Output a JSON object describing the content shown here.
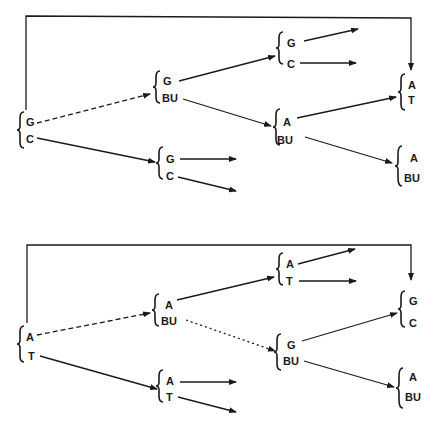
{
  "diagrams": [
    {
      "id": "top",
      "nodes": [
        {
          "id": "t_root",
          "top": "G",
          "bottom": "C"
        },
        {
          "id": "t_mid_upper",
          "top": "G",
          "bottom": "BU"
        },
        {
          "id": "t_mid_lower",
          "top": "G",
          "bottom": "C"
        },
        {
          "id": "t_r1",
          "top": "G",
          "bottom": "C"
        },
        {
          "id": "t_r2",
          "top": "A",
          "bottom": "BU"
        },
        {
          "id": "t_far1",
          "top": "A",
          "bottom": "T"
        },
        {
          "id": "t_far2",
          "top": "A",
          "bottom": "BU"
        }
      ]
    },
    {
      "id": "bottom",
      "nodes": [
        {
          "id": "b_root",
          "top": "A",
          "bottom": "T"
        },
        {
          "id": "b_mid_upper",
          "top": "A",
          "bottom": "BU"
        },
        {
          "id": "b_mid_lower",
          "top": "A",
          "bottom": "T"
        },
        {
          "id": "b_r1",
          "top": "A",
          "bottom": "T"
        },
        {
          "id": "b_r2",
          "top": "G",
          "bottom": "BU"
        },
        {
          "id": "b_far1",
          "top": "G",
          "bottom": "C"
        },
        {
          "id": "b_far2",
          "top": "A",
          "bottom": "BU"
        }
      ]
    }
  ],
  "colors": {
    "ink": "#1a1a1a",
    "background": "#ffffff"
  }
}
